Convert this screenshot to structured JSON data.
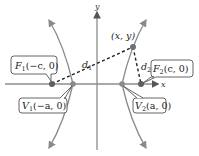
{
  "diagram": {
    "type": "hyperbola-definition",
    "axes": {
      "x_label": "x",
      "y_label": "y"
    },
    "point": {
      "label": "(x, y)"
    },
    "distances": [
      {
        "label": "d",
        "sub": "1"
      },
      {
        "label": "d",
        "sub": "2"
      }
    ],
    "foci": [
      {
        "name": "F",
        "sub": "1",
        "coords": "(−c, 0)"
      },
      {
        "name": "F",
        "sub": "2",
        "coords": "(c, 0)"
      }
    ],
    "vertices": [
      {
        "name": "V",
        "sub": "1",
        "coords": "(−a, 0)"
      },
      {
        "name": "V",
        "sub": "2",
        "coords": "(a, 0)"
      }
    ],
    "colors": {
      "curve": "#8a8a8a",
      "axis": "#7d7d7d",
      "dashed": "#222222",
      "dot": "#6f6f6f",
      "callout_border": "#555555"
    }
  }
}
